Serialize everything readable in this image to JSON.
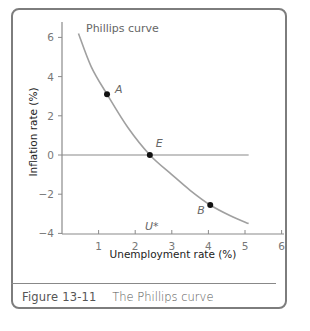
{
  "figure": {
    "number": "Figure 13-11",
    "caption": "The Phillips curve"
  },
  "chart_data": {
    "type": "line",
    "title": "The Phillips curve",
    "xlabel": "Unemployment rate (%)",
    "ylabel": "Inflation rate (%)",
    "xlim": [
      0,
      6
    ],
    "ylim": [
      -4,
      7
    ],
    "x_ticks": [
      1,
      2,
      3,
      4,
      5,
      6
    ],
    "y_ticks": [
      -4,
      -2,
      0,
      2,
      4,
      6
    ],
    "grid": false,
    "series": [
      {
        "name": "Phillips curve",
        "x": [
          0.45,
          0.8,
          1.23,
          1.8,
          2.4,
          3.0,
          3.5,
          4.05,
          4.6,
          5.1
        ],
        "y": [
          6.2,
          4.5,
          3.1,
          1.4,
          0.0,
          -1.0,
          -1.8,
          -2.55,
          -3.1,
          -3.5
        ]
      },
      {
        "name": "Zero inflation line",
        "x": [
          0,
          5.1
        ],
        "y": [
          0,
          0
        ]
      }
    ],
    "points": [
      {
        "label": "A",
        "x": 1.23,
        "y": 3.1
      },
      {
        "label": "E",
        "x": 2.4,
        "y": 0.0
      },
      {
        "label": "B",
        "x": 4.05,
        "y": -2.55
      }
    ],
    "annotations": [
      {
        "text": "Phillips curve",
        "x": 1.1,
        "y": 6.6
      },
      {
        "text": "U*",
        "x": 2.4,
        "y": -3.7
      }
    ]
  }
}
